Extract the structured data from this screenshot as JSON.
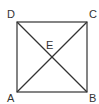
{
  "diagram": {
    "type": "geometry",
    "shape": "square with diagonals",
    "points": {
      "A": {
        "label": "A",
        "x": 17,
        "y": 92
      },
      "B": {
        "label": "B",
        "x": 87,
        "y": 92
      },
      "C": {
        "label": "C",
        "x": 87,
        "y": 22
      },
      "D": {
        "label": "D",
        "x": 17,
        "y": 22
      },
      "E": {
        "label": "E",
        "x": 52,
        "y": 57
      }
    },
    "segments": [
      "AB",
      "BC",
      "CD",
      "DA",
      "AC",
      "BD"
    ],
    "colors": {
      "stroke": "#333333",
      "background": "#ffffff"
    }
  }
}
